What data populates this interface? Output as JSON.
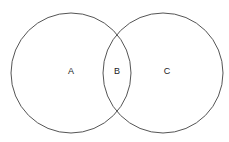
{
  "diagram": {
    "type": "venn",
    "stroke_color": "#555555",
    "circles": [
      {
        "name": "left",
        "cx": 71,
        "cy": 73,
        "r": 60
      },
      {
        "name": "right",
        "cx": 163,
        "cy": 73,
        "r": 60
      }
    ],
    "labels": [
      {
        "text": "A",
        "x": 71,
        "y": 74
      },
      {
        "text": "B",
        "x": 117,
        "y": 74
      },
      {
        "text": "C",
        "x": 167,
        "y": 74
      }
    ]
  }
}
